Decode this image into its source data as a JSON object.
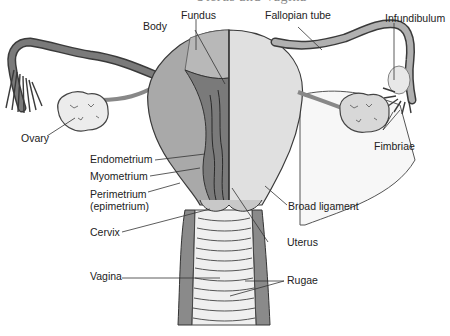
{
  "figure": {
    "title_clipped": "Uterus and Vagina"
  },
  "labels": {
    "body": "Body",
    "fundus": "Fundus",
    "fallopian_tube": "Fallopian tube",
    "infundibulum": "Infundibulum",
    "ovary": "Ovary",
    "fimbriae": "Fimbriae",
    "endometrium": "Endometrium",
    "myometrium": "Myometrium",
    "perimetrium_line1": "Perimetrium",
    "perimetrium_line2": "(epimetrium)",
    "broad_ligament": "Broad ligament",
    "cervix": "Cervix",
    "uterus": "Uterus",
    "vagina": "Vagina",
    "rugae": "Rugae"
  },
  "colors": {
    "tissue_dark": "#7a7a7a",
    "tissue_mid": "#a9a9a9",
    "tissue_light": "#d9d9d9",
    "tissue_pale": "#ececec",
    "outline": "#3a3a3a",
    "leader_line": "#333333",
    "text": "#222222"
  }
}
